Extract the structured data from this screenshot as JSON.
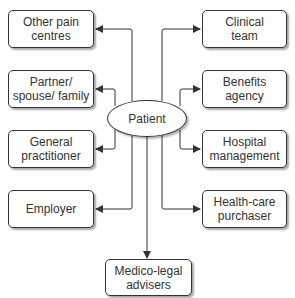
{
  "diagram": {
    "center": {
      "label": "Patient"
    },
    "left_nodes": [
      {
        "label": "Other pain\ncentres"
      },
      {
        "label": "Partner/\nspouse/ family"
      },
      {
        "label": "General\npractitioner"
      },
      {
        "label": "Employer"
      }
    ],
    "right_nodes": [
      {
        "label": "Clinical\nteam"
      },
      {
        "label": "Benefits\nagency"
      },
      {
        "label": "Hospital\nmanagement"
      },
      {
        "label": "Health-care\npurchaser"
      }
    ],
    "bottom_node": {
      "label": "Medico-legal\nadvisers"
    },
    "colors": {
      "line": "#333333",
      "box_border": "#333333",
      "text": "#333333"
    }
  }
}
